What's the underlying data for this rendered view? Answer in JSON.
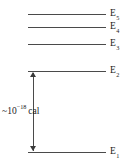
{
  "diagram": {
    "type": "energy-level-diagram",
    "background_color": "#ffffff",
    "line_color": "#4a4a4a",
    "text_color": "#1a1a1a",
    "levels": [
      {
        "id": "E5",
        "label_base": "E",
        "label_sub": "5",
        "y": 14,
        "x_start": 28,
        "x_end": 106
      },
      {
        "id": "E4",
        "label_base": "E",
        "label_sub": "4",
        "y": 27,
        "x_start": 28,
        "x_end": 106
      },
      {
        "id": "E3",
        "label_base": "E",
        "label_sub": "3",
        "y": 44,
        "x_start": 28,
        "x_end": 106
      },
      {
        "id": "E2",
        "label_base": "E",
        "label_sub": "2",
        "y": 71,
        "x_start": 28,
        "x_end": 106
      },
      {
        "id": "E1",
        "label_base": "E",
        "label_sub": "1",
        "y": 152,
        "x_start": 28,
        "x_end": 106
      }
    ],
    "gap_arrow": {
      "from_level": "E1",
      "to_level": "E2",
      "x": 33,
      "y_top": 71,
      "y_bottom": 152,
      "double_headed": true
    },
    "annotation": {
      "tilde": "~",
      "mantissa": "10",
      "exponent": "−18",
      "unit": "cal",
      "full_text": "~10⁻¹⁸ cal"
    }
  }
}
